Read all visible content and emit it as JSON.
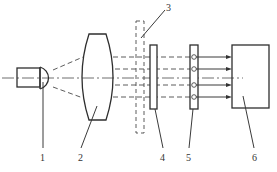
{
  "diagram": {
    "type": "optical-system-schematic",
    "components": [
      {
        "id": "1",
        "label": "1",
        "name": "light-source"
      },
      {
        "id": "2",
        "name": "condenser-lens",
        "label": "2"
      },
      {
        "id": "3",
        "name": "dashed-aperture-element",
        "label": "3"
      },
      {
        "id": "4",
        "name": "plate-element",
        "label": "4"
      },
      {
        "id": "5",
        "name": "detector-plate-with-pinholes",
        "label": "5"
      },
      {
        "id": "6",
        "name": "receiver-box",
        "label": "6"
      }
    ],
    "ray_count": 4,
    "colors": {
      "line": "#3a3a3a",
      "background": "#ffffff"
    }
  },
  "labels": {
    "l1": "1",
    "l2": "2",
    "l3": "3",
    "l4": "4",
    "l5": "5",
    "l6": "6"
  }
}
